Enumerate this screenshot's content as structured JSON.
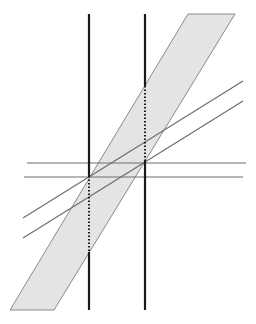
{
  "diagram": {
    "width": 256,
    "height": 324,
    "background": "#ffffff",
    "band": {
      "fill": "#e4e4e4",
      "stroke": "#8a8a8a",
      "points": [
        [
          188,
          14
        ],
        [
          235,
          14
        ],
        [
          54,
          310
        ],
        [
          10,
          310
        ]
      ]
    },
    "vertical_lines": [
      {
        "x": 89,
        "y1": 14,
        "y2": 310,
        "dotted_from": 176,
        "dotted_to": 252,
        "color": "#1a1a1a"
      },
      {
        "x": 145,
        "y1": 14,
        "y2": 310,
        "dotted_from": 86,
        "dotted_to": 160,
        "color": "#1a1a1a"
      }
    ],
    "horizontal_lines": [
      {
        "y": 163,
        "x1": 27,
        "x2": 246,
        "color": "#6e6e6e"
      },
      {
        "y": 177,
        "x1": 24,
        "x2": 243,
        "color": "#6e6e6e"
      }
    ],
    "diagonal_lines": [
      {
        "x1": 23,
        "y1": 218,
        "x2": 243,
        "y2": 81,
        "color": "#6e6e6e"
      },
      {
        "x1": 23,
        "y1": 238,
        "x2": 243,
        "y2": 101,
        "color": "#6e6e6e"
      }
    ]
  }
}
